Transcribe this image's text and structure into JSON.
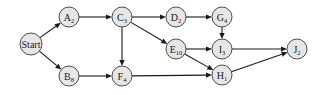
{
  "diagram": {
    "type": "activity-network",
    "nodes": [
      {
        "id": "Start",
        "label": "Start",
        "sub": "",
        "x": 31,
        "y": 44,
        "r": 11
      },
      {
        "id": "A",
        "label": "A",
        "sub": "2",
        "x": 69,
        "y": 17,
        "r": 10
      },
      {
        "id": "B",
        "label": "B",
        "sub": "8",
        "x": 69,
        "y": 76,
        "r": 10
      },
      {
        "id": "C",
        "label": "C",
        "sub": "3",
        "x": 122,
        "y": 17,
        "r": 10
      },
      {
        "id": "F",
        "label": "F",
        "sub": "4",
        "x": 122,
        "y": 76,
        "r": 10
      },
      {
        "id": "D",
        "label": "D",
        "sub": "2",
        "x": 176,
        "y": 17,
        "r": 10
      },
      {
        "id": "G",
        "label": "G",
        "sub": "4",
        "x": 222,
        "y": 17,
        "r": 10
      },
      {
        "id": "E",
        "label": "E",
        "sub": "10",
        "x": 176,
        "y": 49,
        "r": 10
      },
      {
        "id": "I",
        "label": "I",
        "sub": "3",
        "x": 222,
        "y": 49,
        "r": 10
      },
      {
        "id": "H",
        "label": "H",
        "sub": "1",
        "x": 222,
        "y": 75,
        "r": 10
      },
      {
        "id": "J",
        "label": "J",
        "sub": "2",
        "x": 297,
        "y": 49,
        "r": 10
      }
    ],
    "edges": [
      {
        "from": "Start",
        "to": "A"
      },
      {
        "from": "Start",
        "to": "B"
      },
      {
        "from": "A",
        "to": "C"
      },
      {
        "from": "B",
        "to": "F"
      },
      {
        "from": "C",
        "to": "D"
      },
      {
        "from": "C",
        "to": "E"
      },
      {
        "from": "C",
        "to": "F"
      },
      {
        "from": "D",
        "to": "G"
      },
      {
        "from": "G",
        "to": "I"
      },
      {
        "from": "E",
        "to": "I"
      },
      {
        "from": "E",
        "to": "H"
      },
      {
        "from": "F",
        "to": "H"
      },
      {
        "from": "I",
        "to": "J"
      },
      {
        "from": "H",
        "to": "J"
      }
    ]
  }
}
